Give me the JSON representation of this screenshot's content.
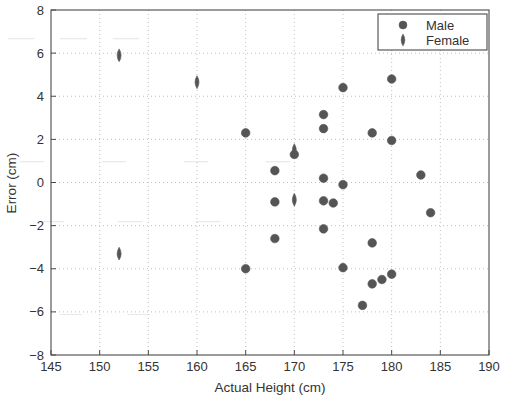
{
  "chart_data": {
    "type": "scatter",
    "title": "",
    "xlabel": "Actual Height (cm)",
    "ylabel": "Error (cm)",
    "xlim": [
      145,
      190
    ],
    "ylim": [
      -8,
      8
    ],
    "xticks": [
      145,
      150,
      155,
      160,
      165,
      170,
      175,
      180,
      185,
      190
    ],
    "yticks": [
      -8,
      -6,
      -4,
      -2,
      0,
      2,
      4,
      6,
      8
    ],
    "grid": true,
    "grid_style": "dotted",
    "legend_position": "top-right",
    "marker_color": "#555555",
    "series": [
      {
        "name": "Male",
        "marker": "circle",
        "color": "#555555",
        "points": [
          [
            165,
            2.3
          ],
          [
            165,
            -4.0
          ],
          [
            168,
            0.55
          ],
          [
            168,
            -0.9
          ],
          [
            168,
            -2.6
          ],
          [
            170,
            1.3
          ],
          [
            173,
            3.15
          ],
          [
            173,
            2.5
          ],
          [
            173,
            0.2
          ],
          [
            173,
            -0.85
          ],
          [
            173,
            -2.15
          ],
          [
            174,
            -0.95
          ],
          [
            175,
            4.4
          ],
          [
            175,
            -0.1
          ],
          [
            175,
            -3.95
          ],
          [
            177,
            -5.7
          ],
          [
            178,
            2.3
          ],
          [
            178,
            -2.8
          ],
          [
            178,
            -4.7
          ],
          [
            179,
            -4.5
          ],
          [
            180,
            4.8
          ],
          [
            180,
            1.95
          ],
          [
            180,
            -4.25
          ],
          [
            183,
            0.35
          ],
          [
            184,
            -1.4
          ]
        ]
      },
      {
        "name": "Female",
        "marker": "diamond",
        "color": "#555555",
        "points": [
          [
            152,
            5.9
          ],
          [
            152,
            -3.3
          ],
          [
            160,
            4.65
          ],
          [
            170,
            1.5
          ],
          [
            170,
            -0.8
          ]
        ]
      }
    ]
  },
  "legend": {
    "entries": [
      {
        "label": "Male",
        "marker": "circle"
      },
      {
        "label": "Female",
        "marker": "diamond"
      }
    ]
  },
  "background_bleed": {
    "line1": "— — —",
    "line2": "— — — —",
    "line3": "— — —",
    "line4": "— —"
  }
}
